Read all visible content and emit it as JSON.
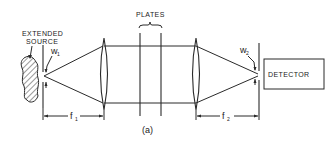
{
  "diagram": {
    "labels": {
      "source": [
        "EXTENDED",
        "SOURCE"
      ],
      "plates": "PLATES",
      "detector": "DETECTOR",
      "w1": "w",
      "w1_sub": "1",
      "w2": "w",
      "w2_sub": "2",
      "f1": "f",
      "f1_sub": "1",
      "f2": "f",
      "f2_sub": "2",
      "caption": "(a)"
    },
    "components": [
      "extended-source",
      "entrance-slit",
      "collimating-lens",
      "plate-1",
      "plate-2",
      "focusing-lens",
      "exit-slit",
      "detector"
    ]
  }
}
